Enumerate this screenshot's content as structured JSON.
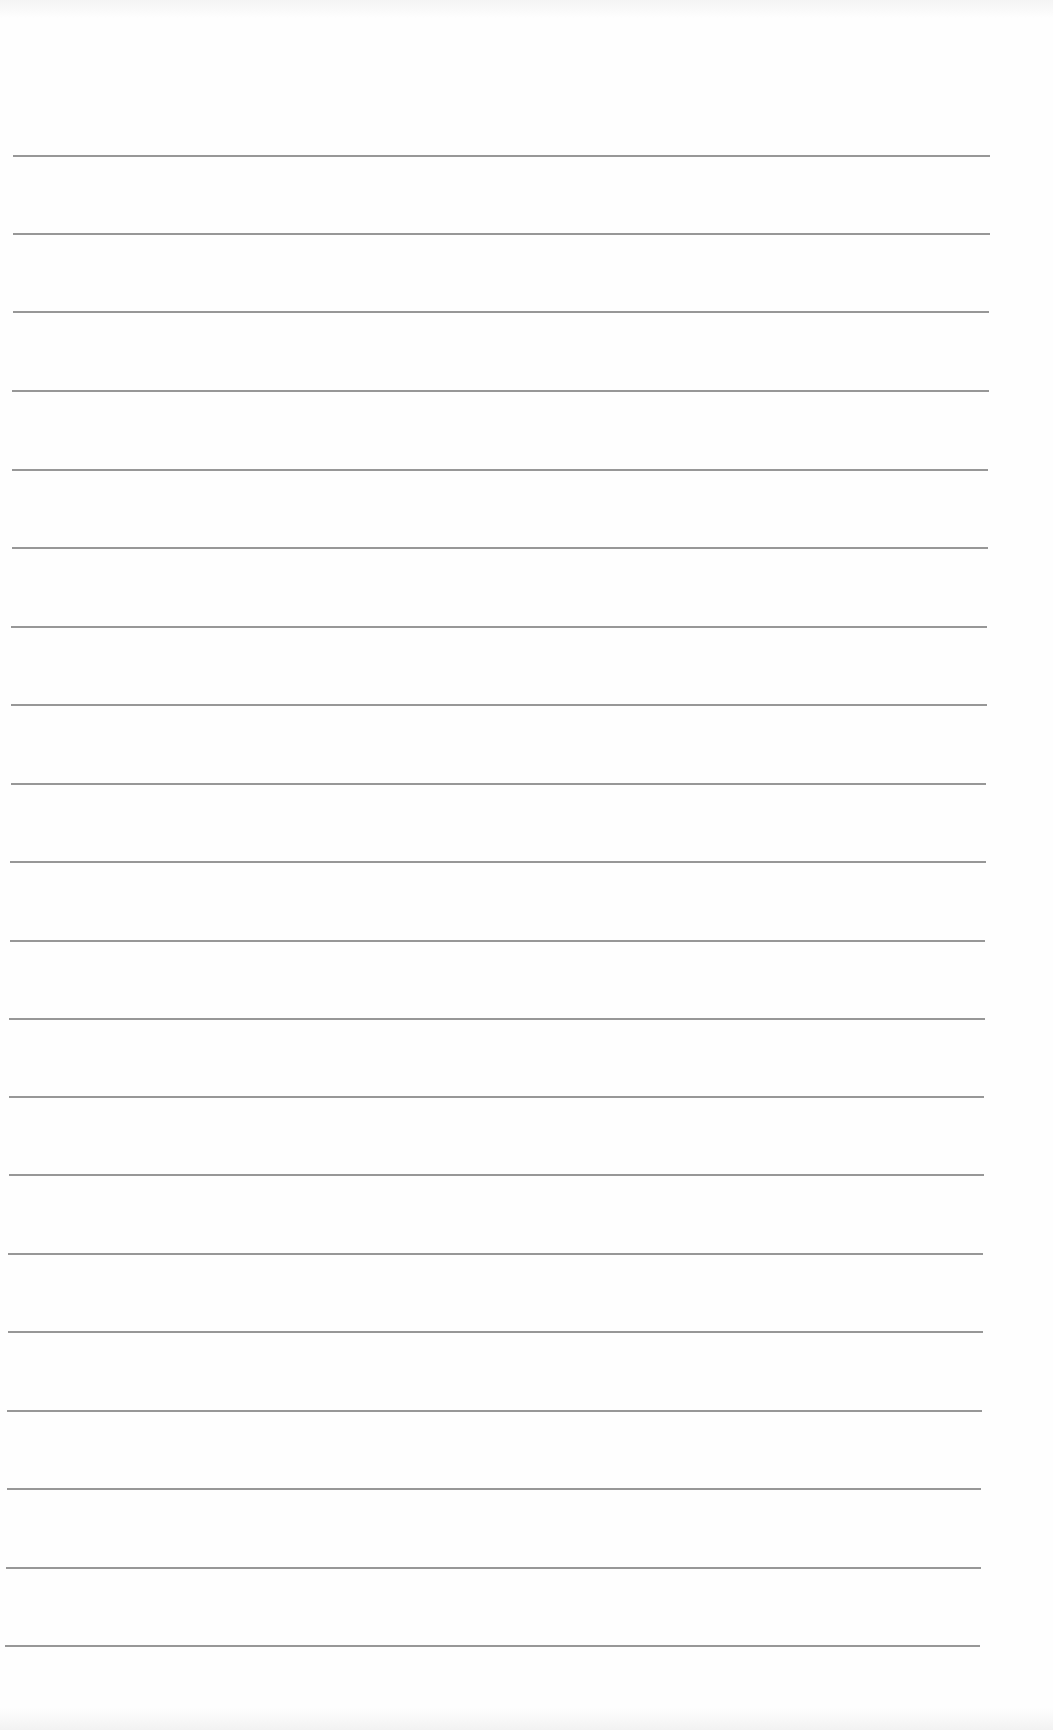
{
  "document": {
    "type": "lined-paper",
    "background_color": "#fefefe",
    "rule_color": "#8c8c8c",
    "rule_count": 20,
    "rules": [
      {
        "y": 156,
        "x1": 13,
        "x2": 990
      },
      {
        "y": 234,
        "x1": 13,
        "x2": 990
      },
      {
        "y": 312,
        "x1": 13,
        "x2": 989
      },
      {
        "y": 391,
        "x1": 12,
        "x2": 989
      },
      {
        "y": 470,
        "x1": 12,
        "x2": 988
      },
      {
        "y": 548,
        "x1": 12,
        "x2": 988
      },
      {
        "y": 627,
        "x1": 11,
        "x2": 987
      },
      {
        "y": 705,
        "x1": 11,
        "x2": 987
      },
      {
        "y": 784,
        "x1": 11,
        "x2": 986
      },
      {
        "y": 862,
        "x1": 10,
        "x2": 986
      },
      {
        "y": 941,
        "x1": 10,
        "x2": 985
      },
      {
        "y": 1019,
        "x1": 9,
        "x2": 985
      },
      {
        "y": 1097,
        "x1": 9,
        "x2": 984
      },
      {
        "y": 1175,
        "x1": 9,
        "x2": 984
      },
      {
        "y": 1254,
        "x1": 8,
        "x2": 983
      },
      {
        "y": 1332,
        "x1": 8,
        "x2": 983
      },
      {
        "y": 1411,
        "x1": 7,
        "x2": 982
      },
      {
        "y": 1489,
        "x1": 7,
        "x2": 981
      },
      {
        "y": 1568,
        "x1": 6,
        "x2": 981
      },
      {
        "y": 1646,
        "x1": 5,
        "x2": 980
      }
    ]
  }
}
